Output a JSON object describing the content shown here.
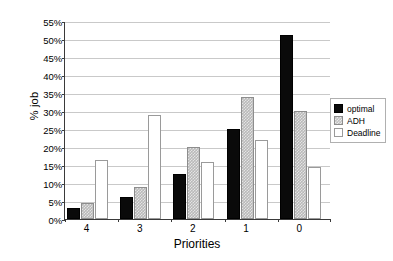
{
  "chart_data": {
    "type": "bar",
    "title": "",
    "xlabel": "Priorities",
    "ylabel": "% job",
    "categories": [
      "4",
      "3",
      "2",
      "1",
      "0"
    ],
    "ylim": [
      0,
      55
    ],
    "ytick_step": 5,
    "ytick_labels": [
      "0%",
      "5%",
      "10%",
      "15%",
      "20%",
      "25%",
      "30%",
      "35%",
      "40%",
      "45%",
      "50%",
      "55%"
    ],
    "ytick_values": [
      0,
      5,
      10,
      15,
      20,
      25,
      30,
      35,
      40,
      45,
      50,
      55
    ],
    "grid": true,
    "legend_position": "right",
    "series": [
      {
        "name": "optimal",
        "color": "#0a0a0a",
        "fill": "solid-black",
        "values": [
          3.0,
          6.0,
          12.5,
          25.0,
          51.0
        ]
      },
      {
        "name": "ADH",
        "color": "#b9b9b9",
        "fill": "gray-dotted",
        "values": [
          4.5,
          9.0,
          20.0,
          34.0,
          30.0
        ]
      },
      {
        "name": "Deadline",
        "color": "#ffffff",
        "fill": "white-outline",
        "values": [
          16.5,
          29.0,
          15.8,
          22.0,
          14.5
        ]
      }
    ]
  },
  "legend": {
    "items": [
      {
        "label": "optimal"
      },
      {
        "label": "ADH"
      },
      {
        "label": "Deadline"
      }
    ]
  }
}
